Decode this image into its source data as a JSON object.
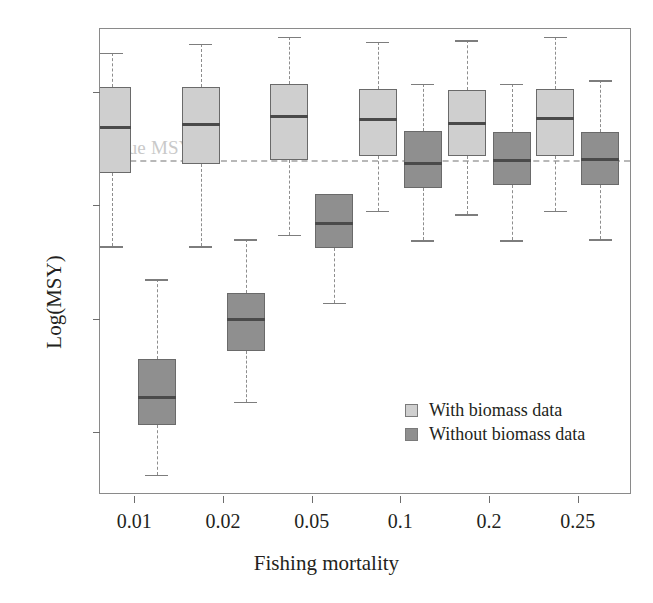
{
  "chart_data": {
    "type": "box",
    "title": "",
    "xlabel": "Fishing mortality",
    "ylabel": "Log(MSY)",
    "categories": [
      "0.01",
      "0.02",
      "0.05",
      "0.1",
      "0.2",
      "0.25"
    ],
    "ylim": [
      -7.55,
      -3.45
    ],
    "yticks": [
      -4,
      -5,
      -6,
      -7
    ],
    "ytick_labels": [
      "−4",
      "−5",
      "−6",
      "−7"
    ],
    "grid": false,
    "legend_position": "inside-bottom-right",
    "annotations": [
      {
        "name": "true-msy",
        "label": "True MSY",
        "type": "hline",
        "y": -4.6,
        "style": "dashed"
      }
    ],
    "series": [
      {
        "name": "With biomass data",
        "color": "#cfcfcf",
        "boxes": [
          {
            "category": "0.01",
            "whisker_low": -5.36,
            "q1": -4.72,
            "median": -4.32,
            "q3": -3.96,
            "whisker_high": -3.66
          },
          {
            "category": "0.02",
            "whisker_low": -5.36,
            "q1": -4.64,
            "median": -4.29,
            "q3": -3.96,
            "whisker_high": -3.58
          },
          {
            "category": "0.05",
            "whisker_low": -5.26,
            "q1": -4.6,
            "median": -4.22,
            "q3": -3.93,
            "whisker_high": -3.52
          },
          {
            "category": "0.1",
            "whisker_low": -5.05,
            "q1": -4.57,
            "median": -4.25,
            "q3": -3.98,
            "whisker_high": -3.56
          },
          {
            "category": "0.2",
            "whisker_low": -5.08,
            "q1": -4.57,
            "median": -4.28,
            "q3": -3.99,
            "whisker_high": -3.55
          },
          {
            "category": "0.25",
            "whisker_low": -5.05,
            "q1": -4.57,
            "median": -4.24,
            "q3": -3.98,
            "whisker_high": -3.52
          }
        ]
      },
      {
        "name": "Without biomass data",
        "color": "#8f8f8f",
        "boxes": [
          {
            "category": "0.01",
            "whisker_low": -7.37,
            "q1": -6.93,
            "median": -6.69,
            "q3": -6.35,
            "whisker_high": -5.65
          },
          {
            "category": "0.02",
            "whisker_low": -6.73,
            "q1": -6.28,
            "median": -6.01,
            "q3": -5.77,
            "whisker_high": -5.3
          },
          {
            "category": "0.05",
            "whisker_low": -5.86,
            "q1": -5.38,
            "median": -5.16,
            "q3": -4.9,
            "whisker_high": -4.98
          },
          {
            "category": "0.1",
            "whisker_low": -5.31,
            "q1": -4.85,
            "median": -4.63,
            "q3": -4.35,
            "whisker_high": -3.93
          },
          {
            "category": "0.2",
            "whisker_low": -5.31,
            "q1": -4.82,
            "median": -4.61,
            "q3": -4.36,
            "whisker_high": -3.93
          },
          {
            "category": "0.25",
            "whisker_low": -5.3,
            "q1": -4.82,
            "median": -4.6,
            "q3": -4.36,
            "whisker_high": -3.9
          }
        ]
      }
    ]
  },
  "legend": {
    "items": [
      {
        "label": "With biomass data",
        "swatch": "light"
      },
      {
        "label": "Without biomass data",
        "swatch": "dark"
      }
    ]
  }
}
